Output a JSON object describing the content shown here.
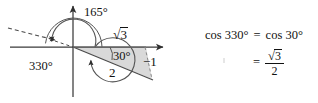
{
  "figure": {
    "type": "trigonometry-unit-circle-diagram",
    "title_text": "",
    "colors": {
      "ink": "#111111",
      "axis": "#3a3a3a",
      "arc": "#555555",
      "triangle_fill": "#d9d9d9",
      "triangle_stroke": "#6b6b6b",
      "dashed": "#4a4a4a",
      "background": "#ffffff"
    },
    "labels": {
      "angle_outer": "165°",
      "angle_reflex": "330°",
      "angle_reference": "30°",
      "hypotenuse": "2",
      "adjacent_radical_sign": "√",
      "adjacent_radicand": "3",
      "opposite": "−1"
    },
    "axes": {
      "x_axis_arrow": true,
      "y_axis_arrow": true,
      "origin": "O"
    },
    "rays": {
      "dashed_ray_label": "terminal-ray-165",
      "solid_ray_label": "terminal-ray-330"
    }
  },
  "equations": {
    "line1": {
      "lhs": "cos 330°",
      "equals": "=",
      "rhs": "cos 30°"
    },
    "line2": {
      "equals": "=",
      "numerator_radical_sign": "√",
      "numerator_radicand": "3",
      "denominator": "2"
    }
  }
}
